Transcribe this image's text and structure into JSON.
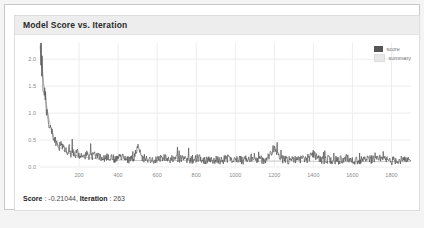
{
  "panel": {
    "title": "Model Score vs. Iteration"
  },
  "status": {
    "score_label": "Score",
    "score_value": "-0.21044",
    "iteration_label": "Iteration",
    "iteration_value": "263",
    "full_text": "Score : -0.21044, Iteration : 263"
  },
  "legend": {
    "items": [
      {
        "label": "score",
        "color": "#555555"
      },
      {
        "label": "summary",
        "color": "#e8e8e8"
      }
    ]
  },
  "colors": {
    "panel_header_bg": "#ededed",
    "panel_border": "#dddddd",
    "grid": "#ededed",
    "axis_text": "#8a8a8a",
    "series_score": "#555555",
    "series_summary": "#b0b0b0",
    "page_bg": "#f4f4f4"
  },
  "chart_data": {
    "type": "line",
    "title": "Model Score vs. Iteration",
    "xlabel": "",
    "ylabel": "",
    "xlim": [
      0,
      1900
    ],
    "ylim": [
      0.0,
      2.3
    ],
    "grid": true,
    "legend_position": "top-right",
    "xticks": [
      200,
      400,
      600,
      800,
      1000,
      1200,
      1400,
      1600,
      1800
    ],
    "xtick_labels": [
      "200",
      "400",
      "600",
      "800",
      "1000",
      "1200",
      "1400",
      "1600",
      "1800"
    ],
    "yticks": [
      0.0,
      0.5,
      1.0,
      1.5,
      2.0
    ],
    "ytick_labels": [
      "0.0",
      "0.5",
      "1.0",
      "1.5",
      "2.0"
    ],
    "series": [
      {
        "name": "score",
        "color": "#555555",
        "description": "Noisy training score per iteration: starts near 2.25 at iteration 0, decays steeply to ~0.5 by iteration 80, then fluctuates around 0.05-0.25 for the rest of the run with occasional spikes up to ~0.6 near iterations 500 and 1200.",
        "x": [
          0,
          5,
          10,
          15,
          20,
          25,
          30,
          35,
          40,
          45,
          50,
          55,
          60,
          65,
          70,
          75,
          80,
          85,
          90,
          95,
          100,
          110,
          120,
          130,
          140,
          150,
          160,
          170,
          180,
          190,
          200,
          220,
          240,
          260,
          280,
          300,
          320,
          340,
          360,
          380,
          400,
          440,
          480,
          500,
          520,
          560,
          600,
          640,
          680,
          720,
          760,
          800,
          840,
          880,
          920,
          960,
          1000,
          1040,
          1080,
          1120,
          1160,
          1200,
          1240,
          1280,
          1320,
          1360,
          1400,
          1440,
          1480,
          1520,
          1560,
          1600,
          1640,
          1680,
          1720,
          1760,
          1800,
          1840,
          1880
        ],
        "y": [
          2.25,
          2.05,
          1.8,
          1.58,
          1.4,
          1.22,
          1.1,
          0.98,
          0.88,
          0.8,
          0.72,
          0.66,
          0.6,
          0.55,
          0.5,
          0.47,
          0.44,
          0.41,
          0.39,
          0.36,
          0.34,
          0.45,
          0.3,
          0.4,
          0.26,
          0.33,
          0.22,
          0.31,
          0.2,
          0.28,
          0.24,
          0.18,
          0.27,
          0.16,
          0.25,
          0.2,
          0.14,
          0.22,
          0.17,
          0.13,
          0.21,
          0.15,
          0.12,
          0.58,
          0.18,
          0.14,
          0.11,
          0.19,
          0.13,
          0.16,
          0.1,
          0.18,
          0.12,
          0.15,
          0.09,
          0.17,
          0.13,
          0.11,
          0.2,
          0.12,
          0.14,
          0.55,
          0.15,
          0.11,
          0.18,
          0.13,
          0.32,
          0.12,
          0.16,
          0.1,
          0.19,
          0.13,
          0.11,
          0.17,
          0.12,
          0.15,
          0.1,
          0.14,
          0.09
        ]
      },
      {
        "name": "summary",
        "color": "#b0b0b0",
        "description": "Smoothed running summary of the score: monotonic decay from ~2.25 at iteration 0 to ~0.12 by iteration 400, flat thereafter.",
        "x": [
          0,
          10,
          20,
          30,
          40,
          50,
          60,
          70,
          80,
          90,
          100,
          120,
          140,
          160,
          180,
          200,
          250,
          300,
          350,
          400,
          500,
          700,
          900,
          1100,
          1300,
          1500,
          1700,
          1900
        ],
        "y": [
          2.25,
          1.86,
          1.52,
          1.24,
          1.0,
          0.82,
          0.68,
          0.57,
          0.48,
          0.42,
          0.37,
          0.31,
          0.27,
          0.24,
          0.22,
          0.2,
          0.17,
          0.15,
          0.14,
          0.13,
          0.12,
          0.12,
          0.11,
          0.11,
          0.11,
          0.1,
          0.1,
          0.1
        ]
      }
    ]
  }
}
